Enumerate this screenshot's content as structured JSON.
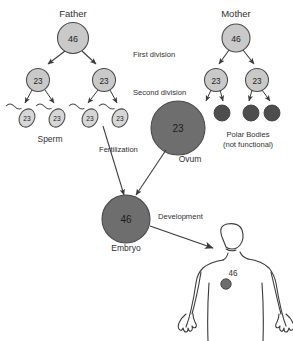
{
  "diagram": {
    "title_father": "Father",
    "title_mother": "Mother",
    "stage_labels": {
      "first_division": "First division",
      "second_division": "Second division",
      "fertilization": "Fertilization",
      "development": "Development"
    },
    "captions": {
      "sperm": "Sperm",
      "ovum": "Ovum",
      "embryo": "Embryo",
      "polar_bodies_line1": "Polar Bodies",
      "polar_bodies_line2": "(not functional)"
    },
    "chromosome_counts": {
      "diploid": "46",
      "haploid": "23",
      "father_parent": "46",
      "mother_parent": "46",
      "father_meiosis1_left": "23",
      "father_meiosis1_right": "23",
      "mother_meiosis1_left": "23",
      "mother_meiosis1_right": "23",
      "sperm_1": "23",
      "sperm_2": "23",
      "sperm_3": "23",
      "sperm_4": "23",
      "ovum": "23",
      "embryo": "46",
      "body_cell": "46"
    },
    "colors": {
      "light_cell_fill": "#c9c9c9",
      "cell_stroke": "#4a4a4a",
      "dark_cell_fill": "#6e6e6e",
      "polar_body_fill": "#4d4d4d",
      "sperm_fill": "#d6d6d6",
      "outline": "#3a3a3a",
      "text": "#2f2f2f",
      "background": "#ffffff"
    }
  }
}
